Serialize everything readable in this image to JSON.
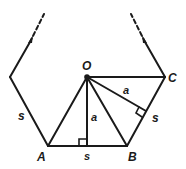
{
  "diagram": {
    "title": "",
    "color": "#1a1a1a",
    "background": "#ffffff",
    "points": {
      "O": {
        "label": "O",
        "x": 87,
        "y": 77
      },
      "A": {
        "label": "A",
        "x": 48,
        "y": 146
      },
      "B": {
        "label": "B",
        "x": 127,
        "y": 146
      },
      "C": {
        "label": "C",
        "x": 165,
        "y": 77
      }
    },
    "labels": {
      "O": "O",
      "A": "A",
      "B": "B",
      "C": "C",
      "side_left": "s",
      "side_bottom": "s",
      "side_right": "s",
      "apothem_vertical": "a",
      "apothem_diagonal": "a"
    }
  }
}
